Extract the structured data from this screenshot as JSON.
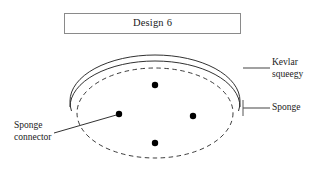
{
  "figure": {
    "title": {
      "text": "Design 6"
    },
    "labels": {
      "kevlar": {
        "line1": "Kevlar",
        "line2": "squeegy"
      },
      "sponge": {
        "line1": "Sponge"
      },
      "connector": {
        "line1": "Sponge",
        "line2": "connector"
      }
    },
    "colors": {
      "stroke": "#1a1a1a",
      "box_border": "#8a8a8a",
      "leader": "#555555",
      "dot": "#000000",
      "background": "#ffffff"
    },
    "geometry": {
      "sponge_ellipse": {
        "cx": 155,
        "cy": 113,
        "rx": 78,
        "ry": 45,
        "style": "dashed"
      },
      "squeegee_arcs": [
        {
          "cx": 155,
          "cy": 104,
          "rx": 85,
          "ry": 45,
          "style": "solid"
        },
        {
          "cx": 155,
          "cy": 110,
          "rx": 85,
          "ry": 45,
          "style": "solid"
        }
      ],
      "connector_dots": [
        {
          "name": "top-dot",
          "x": 155,
          "y": 85
        },
        {
          "name": "left-dot",
          "x": 119,
          "y": 114
        },
        {
          "name": "right-dot",
          "x": 193,
          "y": 116
        },
        {
          "name": "bottom-dot",
          "x": 155,
          "y": 143
        }
      ],
      "dot_radius": 3.2
    }
  }
}
